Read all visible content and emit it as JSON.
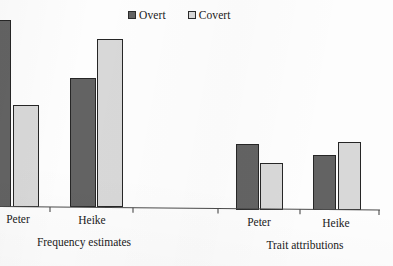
{
  "chart_data": {
    "type": "bar",
    "title": "",
    "subtitle": "",
    "xlabel": "",
    "ylabel": "",
    "grid": false,
    "legend_position": "top-center",
    "axis": {
      "baseline_y_px": 207,
      "ticks_x_px": [
        50,
        133,
        218,
        300,
        378
      ],
      "note": "y-axis not drawn; values are relative bar heights read off the figure"
    },
    "legend": [
      {
        "name": "Overt",
        "color": "#636363"
      },
      {
        "name": "Covert",
        "color": "#d8d8d8"
      }
    ],
    "panels": [
      {
        "label": "Frequency estimates",
        "categories": [
          "Peter",
          "Heike"
        ],
        "series": [
          {
            "name": "Overt",
            "values": [
              100,
              69
            ]
          },
          {
            "name": "Covert",
            "values": [
              54,
              90
            ]
          }
        ]
      },
      {
        "label": "Trait attributions",
        "categories": [
          "Peter",
          "Heike"
        ],
        "series": [
          {
            "name": "Overt",
            "values": [
              34,
              28
            ]
          },
          {
            "name": "Covert",
            "values": [
              24,
              35
            ]
          }
        ]
      }
    ]
  },
  "legend": {
    "overt_label": "Overt",
    "covert_label": "Covert"
  },
  "panels": {
    "left": {
      "group_label": "Frequency estimates",
      "cat1_label": "Peter",
      "cat2_label": "Heike"
    },
    "right": {
      "group_label": "Trait attributions",
      "cat1_label": "Peter",
      "cat2_label": "Heike"
    }
  },
  "colors": {
    "overt": "#636363",
    "covert": "#d8d8d8",
    "outline": "#262626",
    "axis": "#4a4a4a",
    "background": "#fdfdfd"
  },
  "bars": [
    {
      "name": "freq-peter-overt",
      "series": "Overt",
      "x": -2,
      "w": 13,
      "top": 20,
      "color": "#636363",
      "clipped_left": true
    },
    {
      "name": "freq-peter-covert",
      "series": "Covert",
      "x": 13,
      "w": 26,
      "top": 105,
      "color": "#d8d8d8",
      "clipped_left": false
    },
    {
      "name": "freq-heike-overt",
      "series": "Overt",
      "x": 70,
      "w": 26,
      "top": 78,
      "color": "#636363",
      "clipped_left": false
    },
    {
      "name": "freq-heike-covert",
      "series": "Covert",
      "x": 97,
      "w": 26,
      "top": 39,
      "color": "#d8d8d8",
      "clipped_left": false
    },
    {
      "name": "trait-peter-overt",
      "series": "Overt",
      "x": 236,
      "w": 23,
      "top": 144,
      "color": "#636363",
      "clipped_left": false
    },
    {
      "name": "trait-peter-covert",
      "series": "Covert",
      "x": 260,
      "w": 23,
      "top": 163,
      "color": "#d8d8d8",
      "clipped_left": false
    },
    {
      "name": "trait-heike-overt",
      "series": "Overt",
      "x": 313,
      "w": 23,
      "top": 155,
      "color": "#636363",
      "clipped_left": false
    },
    {
      "name": "trait-heike-covert",
      "series": "Covert",
      "x": 338,
      "w": 23,
      "top": 142,
      "color": "#d8d8d8",
      "clipped_left": false
    }
  ]
}
